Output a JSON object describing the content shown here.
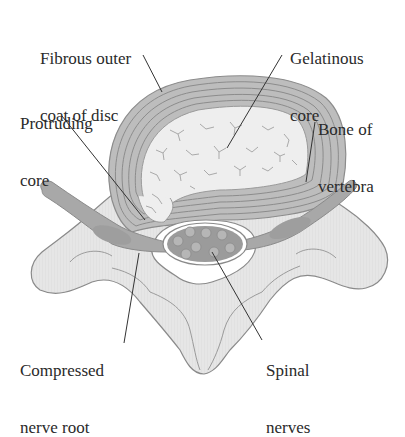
{
  "diagram": {
    "colors": {
      "bone": "#e9e9e9",
      "bone_outline": "#8a8a8a",
      "disc_ring": "#b8b8b8",
      "disc_ring_line": "#8c8c8c",
      "core": "#ececec",
      "core_crack": "#a9a9a9",
      "nerve": "#a3a3a3",
      "canal": "#ffffff",
      "spinal_nerve_bundle": "#9b9b9b",
      "nerve_fiber": "#b6b6b6",
      "leader_line": "#333333",
      "text": "#2a2a2a"
    },
    "labels": [
      {
        "id": "fibrous-outer-coat",
        "lines": [
          "Fibrous outer",
          "coat of disc"
        ]
      },
      {
        "id": "gelatinous-core",
        "lines": [
          "Gelatinous",
          "core"
        ]
      },
      {
        "id": "protruding-core",
        "lines": [
          "Protruding",
          "core"
        ]
      },
      {
        "id": "bone-of-vertebra",
        "lines": [
          "Bone of",
          "vertebra"
        ]
      },
      {
        "id": "compressed-nerve-root",
        "lines": [
          "Compressed",
          "nerve root"
        ]
      },
      {
        "id": "spinal-nerves",
        "lines": [
          "Spinal",
          "nerves"
        ]
      }
    ]
  }
}
